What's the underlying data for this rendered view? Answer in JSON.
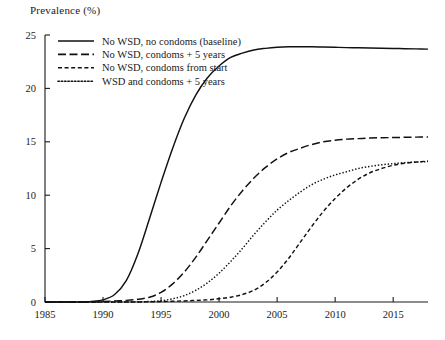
{
  "chart_data": {
    "type": "line",
    "title": "",
    "ylabel": "Prevalence (%)",
    "xlabel": "",
    "xlim": [
      1985,
      2018
    ],
    "ylim": [
      0,
      25
    ],
    "grid": false,
    "legend_position": "top-left-inside",
    "xticks": [
      "1985",
      "1990",
      "1995",
      "2000",
      "2005",
      "2010",
      "2015"
    ],
    "xtick_values": [
      1985,
      1990,
      1995,
      2000,
      2005,
      2010,
      2015
    ],
    "yticks": [
      "0",
      "5",
      "10",
      "15",
      "20",
      "25"
    ],
    "ytick_values": [
      0,
      5,
      10,
      15,
      20,
      25
    ],
    "x": [
      1985,
      1986,
      1987,
      1988,
      1989,
      1990,
      1991,
      1992,
      1993,
      1994,
      1995,
      1996,
      1997,
      1998,
      1999,
      2000,
      2001,
      2002,
      2003,
      2004,
      2005,
      2006,
      2007,
      2008,
      2009,
      2010,
      2011,
      2012,
      2013,
      2014,
      2015,
      2016,
      2017,
      2018
    ],
    "series": [
      {
        "name": "No WSD, no condoms (baseline)",
        "dash": "solid",
        "values": [
          0,
          0,
          0,
          0,
          0.05,
          0.2,
          0.7,
          2.0,
          4.5,
          7.8,
          11.2,
          14.4,
          17.2,
          19.4,
          21.0,
          22.1,
          22.9,
          23.3,
          23.6,
          23.75,
          23.85,
          23.9,
          23.9,
          23.9,
          23.88,
          23.85,
          23.82,
          23.8,
          23.78,
          23.76,
          23.74,
          23.72,
          23.7,
          23.68
        ]
      },
      {
        "name": "No WSD, condoms + 5 years",
        "dash": "long-dash",
        "values": [
          0,
          0,
          0,
          0,
          0,
          0.05,
          0.1,
          0.15,
          0.25,
          0.45,
          0.9,
          1.7,
          2.8,
          4.2,
          5.8,
          7.4,
          9.0,
          10.4,
          11.6,
          12.6,
          13.4,
          14.0,
          14.4,
          14.75,
          15.0,
          15.15,
          15.25,
          15.3,
          15.35,
          15.38,
          15.4,
          15.42,
          15.44,
          15.45
        ]
      },
      {
        "name": "No WSD, condoms from start",
        "dash": "short-dash",
        "values": [
          0,
          0,
          0,
          0,
          0,
          0,
          0,
          0,
          0,
          0.02,
          0.04,
          0.07,
          0.1,
          0.15,
          0.2,
          0.3,
          0.45,
          0.7,
          1.1,
          1.8,
          2.8,
          4.1,
          5.6,
          7.1,
          8.5,
          9.7,
          10.7,
          11.5,
          12.1,
          12.5,
          12.8,
          13.0,
          13.1,
          13.2
        ]
      },
      {
        "name": "WSD and condoms + 5 years",
        "dash": "dotted",
        "values": [
          0,
          0,
          0,
          0,
          0,
          0,
          0,
          0,
          0.02,
          0.05,
          0.12,
          0.3,
          0.6,
          1.1,
          1.8,
          2.7,
          3.8,
          5.0,
          6.3,
          7.5,
          8.6,
          9.5,
          10.3,
          11.0,
          11.5,
          11.9,
          12.2,
          12.5,
          12.7,
          12.85,
          12.95,
          13.05,
          13.1,
          13.15
        ]
      }
    ]
  },
  "legend": {
    "entries": [
      {
        "label": "No WSD, no condoms (baseline)"
      },
      {
        "label": "No WSD, condoms + 5 years"
      },
      {
        "label": "No WSD, condoms from start"
      },
      {
        "label": "WSD and condoms + 5 years"
      }
    ]
  },
  "colors": {
    "ink": "#111111",
    "background": "#ffffff"
  }
}
